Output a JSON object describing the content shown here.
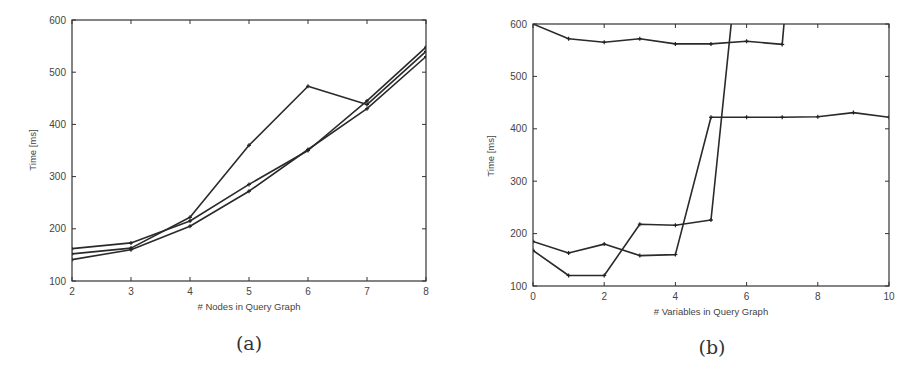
{
  "chart_data": [
    {
      "id": "a",
      "type": "line",
      "caption": "(a)",
      "title": "",
      "xlabel": "# Nodes in Query Graph",
      "ylabel": "Time [ms]",
      "x": [
        2,
        3,
        4,
        5,
        6,
        7,
        8
      ],
      "xticks": [
        "2",
        "3",
        "4",
        "5",
        "6",
        "7",
        "8"
      ],
      "yticks": [
        "100",
        "200",
        "300",
        "400",
        "500",
        "600"
      ],
      "xlim": [
        2,
        8
      ],
      "ylim": [
        100,
        600
      ],
      "grid": false,
      "legend": "none",
      "series": [
        {
          "name": "series-1",
          "values": [
            152,
            163,
            222,
            360,
            473,
            438,
            540
          ]
        },
        {
          "name": "series-2",
          "values": [
            162,
            173,
            215,
            285,
            350,
            445,
            548
          ]
        },
        {
          "name": "series-3",
          "values": [
            141,
            160,
            205,
            272,
            352,
            430,
            530
          ]
        }
      ]
    },
    {
      "id": "b",
      "type": "line",
      "caption": "(b)",
      "title": "",
      "xlabel": "# Variables in Query Graph",
      "ylabel": "Time [ms]",
      "x": [
        0,
        1,
        2,
        3,
        4,
        5,
        6,
        7,
        8,
        9,
        10
      ],
      "xticks": [
        "0",
        "2",
        "4",
        "6",
        "8",
        "10"
      ],
      "xtick_values": [
        0,
        2,
        4,
        6,
        8,
        10
      ],
      "yticks": [
        "100",
        "200",
        "300",
        "400",
        "500",
        "600"
      ],
      "xlim": [
        0,
        10
      ],
      "ylim": [
        100,
        600
      ],
      "grid": false,
      "legend": "none",
      "series": [
        {
          "name": "series-1",
          "values": [
            185,
            163,
            180,
            158,
            160,
            422,
            422,
            422,
            423,
            431,
            422
          ]
        },
        {
          "name": "series-2",
          "values": [
            168,
            120,
            120,
            218,
            216,
            226,
            700,
            null,
            null,
            null,
            null
          ]
        },
        {
          "name": "series-3",
          "values": [
            600,
            572,
            565,
            572,
            562,
            562,
            567,
            561,
            700,
            null,
            null
          ]
        }
      ],
      "notes": "series-2 exits above 600 ms between x=5 and x=6; series-3 exits above 600 ms just after x=7"
    }
  ]
}
